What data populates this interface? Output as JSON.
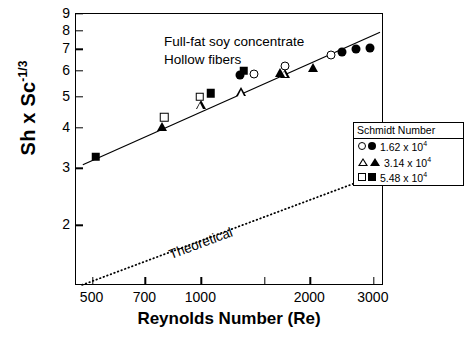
{
  "chart_data": {
    "type": "scatter",
    "title": "",
    "annotation": [
      "Full-fat soy concentrate",
      "Hollow fibers"
    ],
    "xlabel": "Reynolds Number (Re)",
    "ylabel": "Sh x Sc-1/3",
    "ylabel_base": "Sh x Sc",
    "ylabel_exp": "-1/3",
    "xscale": "log",
    "yscale": "log",
    "xlim": [
      450,
      3200
    ],
    "ylim": [
      1.3,
      9.0
    ],
    "grid": false,
    "xticks": [
      500,
      700,
      1000,
      1500,
      2000,
      3000
    ],
    "xtick_labels": [
      "500",
      "700",
      "1000",
      "",
      "2000",
      "3000"
    ],
    "yticks": [
      2,
      3,
      4,
      5,
      6,
      7,
      8,
      9
    ],
    "ytick_labels": [
      "2",
      "3",
      "4",
      "5",
      "6",
      "7",
      "8",
      "9"
    ],
    "legend": {
      "position": "right",
      "title": "Schmidt Number",
      "entries": [
        {
          "label": "1.62 x 10",
          "exponent": "4",
          "open_marker": "circle-open",
          "filled_marker": "circle-filled"
        },
        {
          "label": "3.14 x 10",
          "exponent": "4",
          "open_marker": "tri-open",
          "filled_marker": "tri-filled"
        },
        {
          "label": "5.48 x 10",
          "exponent": "4",
          "open_marker": "square-open",
          "filled_marker": "square-filled"
        }
      ]
    },
    "series": [
      {
        "name": "1.62 x 10^4 open",
        "marker": "circle-open",
        "points": [
          [
            1395,
            5.87
          ],
          [
            1700,
            6.22
          ],
          [
            2280,
            6.7
          ]
        ]
      },
      {
        "name": "3.14 x 10^4 open",
        "marker": "tri-open",
        "points": [
          [
            995,
            4.7
          ],
          [
            1290,
            5.15
          ],
          [
            1700,
            5.88
          ]
        ]
      },
      {
        "name": "5.48 x 10^4 open",
        "marker": "square-open",
        "points": [
          [
            790,
            4.32
          ],
          [
            990,
            5.0
          ]
        ]
      },
      {
        "name": "1.62 x 10^4 filled",
        "marker": "circle-filled",
        "points": [
          [
            1280,
            5.84
          ],
          [
            2450,
            6.88
          ],
          [
            2680,
            7.02
          ],
          [
            2930,
            7.08
          ]
        ]
      },
      {
        "name": "3.14 x 10^4 filled",
        "marker": "tri-filled",
        "points": [
          [
            780,
            4.02
          ],
          [
            1650,
            5.9
          ],
          [
            2040,
            6.12
          ]
        ]
      },
      {
        "name": "5.48 x 10^4 filled",
        "marker": "square-filled",
        "points": [
          [
            510,
            3.26
          ],
          [
            1060,
            5.12
          ],
          [
            1310,
            6.02
          ]
        ]
      }
    ],
    "fit_line": {
      "name": "experimental fit",
      "style": "solid",
      "points": [
        [
          470,
          3.08
        ],
        [
          3120,
          7.9
        ]
      ]
    },
    "theoretical_line": {
      "name": "Theoretical",
      "label": "Theoretical",
      "style": "dotted",
      "points": [
        [
          468,
          1.31
        ],
        [
          3150,
          2.9
        ]
      ]
    }
  }
}
